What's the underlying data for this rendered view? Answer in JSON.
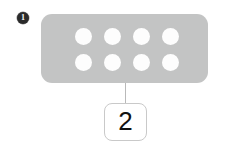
{
  "diagram": {
    "step_badge": {
      "label": "1",
      "icon": "filled-circle-number-badge",
      "fill_color": "#2b2b2b",
      "text_color": "#ffffff"
    },
    "device": {
      "name": "perforated-panel",
      "fill_color": "#c3c4c4",
      "hole_color": "#fdfdfd",
      "hole_rows": 2,
      "hole_columns": 4,
      "hole_count": 8,
      "holes": [
        {
          "row": 1,
          "column": 1
        },
        {
          "row": 1,
          "column": 2
        },
        {
          "row": 1,
          "column": 3
        },
        {
          "row": 1,
          "column": 4
        },
        {
          "row": 2,
          "column": 1
        },
        {
          "row": 2,
          "column": 2
        },
        {
          "row": 2,
          "column": 3
        },
        {
          "row": 2,
          "column": 4
        }
      ]
    },
    "leader_line": {
      "name": "callout-leader",
      "color": "#b9b9b9"
    },
    "callout": {
      "label": "2",
      "border_color": "#c9c9c9",
      "background_color": "#ffffff",
      "text_color": "#111111"
    }
  }
}
